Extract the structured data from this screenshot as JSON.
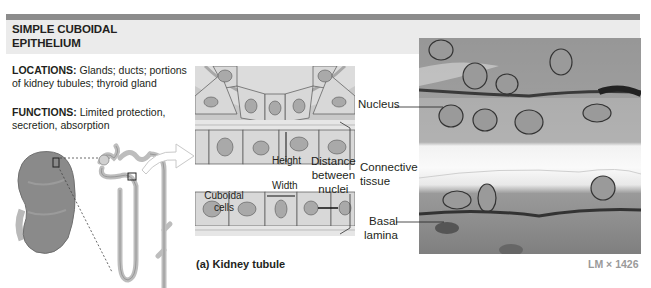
{
  "header": {
    "title_line1": "SIMPLE CUBOIDAL",
    "title_line2": "EPITHELIUM",
    "bar_color": "#8c8c8c",
    "band_color": "#ebebeb"
  },
  "description": {
    "locations_label": "LOCATIONS:",
    "locations_text": " Glands; ducts; portions of kidney tubules; thyroid gland",
    "functions_label": "FUNCTIONS:",
    "functions_text": " Limited protection, secretion, absorption"
  },
  "diagram": {
    "labels": {
      "cuboidal_cells": "Cuboidal cells",
      "height": "Height",
      "width": "Width",
      "distance_line1": "Distance",
      "distance_line2": "between",
      "distance_line3": "nuclei",
      "connective_line1": "Connective",
      "connective_line2": "tissue"
    },
    "caption": "(a) Kidney tubule",
    "illustrations": [
      "kidney-icon",
      "nephron-icon",
      "zoom-arrow-icon",
      "tubule-cross-section"
    ]
  },
  "micrograph": {
    "labels": {
      "nucleus": "Nucleus",
      "basal_line1": "Basal",
      "basal_line2": "lamina"
    },
    "magnification": "LM × 1426"
  }
}
